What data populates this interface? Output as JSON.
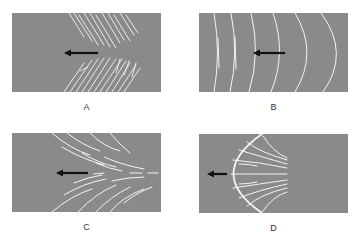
{
  "colors": {
    "background": "#ffffff",
    "panel_fill": "#8a8a8a",
    "line": "#f4f4f4",
    "arrow": "#111111",
    "label": "#333333"
  },
  "panels": [
    {
      "id": "A",
      "label": "A",
      "pattern": "oblique-parallel-streaks",
      "arrow_direction": "left"
    },
    {
      "id": "B",
      "label": "B",
      "pattern": "concentric-arc-fronts",
      "arrow_direction": "left"
    },
    {
      "id": "C",
      "label": "C",
      "pattern": "converging-curved-streaks",
      "arrow_direction": "left"
    },
    {
      "id": "D",
      "label": "D",
      "pattern": "bow-front-with-fanning-lines",
      "arrow_direction": "left"
    }
  ]
}
